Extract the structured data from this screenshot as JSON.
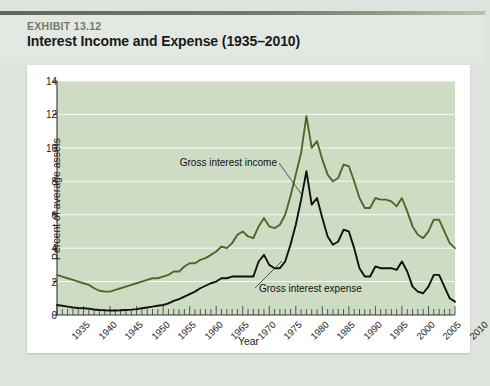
{
  "header": {
    "exhibit_label": "EXHIBIT 13.12",
    "title": "Interest Income and Expense (1935–2010)"
  },
  "chart_data": {
    "type": "line",
    "title": "Interest Income and Expense (1935–2010)",
    "xlabel": "Year",
    "ylabel": "Percent of average assets",
    "xlim": [
      1935,
      2010
    ],
    "ylim": [
      0,
      14
    ],
    "yticks": [
      0,
      2,
      4,
      6,
      8,
      10,
      12,
      14
    ],
    "xticks": [
      1935,
      1940,
      1945,
      1950,
      1955,
      1960,
      1965,
      1970,
      1975,
      1980,
      1985,
      1990,
      1995,
      2000,
      2005,
      2010
    ],
    "grid": "horizontal",
    "legend": "inline-annotations",
    "plot_background": "#cfdcc4",
    "annotations": [
      {
        "text": "Gross interest income",
        "series": "Gross interest income"
      },
      {
        "text": "Gross interest expense",
        "series": "Gross interest expense"
      }
    ],
    "x": [
      1935,
      1936,
      1937,
      1938,
      1939,
      1940,
      1941,
      1942,
      1943,
      1944,
      1945,
      1946,
      1947,
      1948,
      1949,
      1950,
      1951,
      1952,
      1953,
      1954,
      1955,
      1956,
      1957,
      1958,
      1959,
      1960,
      1961,
      1962,
      1963,
      1964,
      1965,
      1966,
      1967,
      1968,
      1969,
      1970,
      1971,
      1972,
      1973,
      1974,
      1975,
      1976,
      1977,
      1978,
      1979,
      1980,
      1981,
      1982,
      1983,
      1984,
      1985,
      1986,
      1987,
      1988,
      1989,
      1990,
      1991,
      1992,
      1993,
      1994,
      1995,
      1996,
      1997,
      1998,
      1999,
      2000,
      2001,
      2002,
      2003,
      2004,
      2005,
      2006,
      2007,
      2008,
      2009,
      2010
    ],
    "series": [
      {
        "name": "Gross interest income",
        "color": "#4b6a27",
        "values": [
          2.4,
          2.3,
          2.2,
          2.1,
          2.0,
          1.9,
          1.8,
          1.6,
          1.45,
          1.4,
          1.4,
          1.5,
          1.6,
          1.7,
          1.8,
          1.9,
          2.0,
          2.1,
          2.2,
          2.2,
          2.3,
          2.4,
          2.6,
          2.6,
          2.9,
          3.1,
          3.1,
          3.3,
          3.4,
          3.6,
          3.8,
          4.1,
          4.0,
          4.3,
          4.8,
          5.0,
          4.7,
          4.6,
          5.3,
          5.8,
          5.3,
          5.2,
          5.4,
          6.0,
          7.1,
          8.4,
          9.7,
          11.9,
          10.0,
          10.4,
          9.3,
          8.4,
          8.0,
          8.2,
          9.0,
          8.9,
          8.0,
          7.0,
          6.4,
          6.4,
          7.0,
          6.9,
          6.9,
          6.8,
          6.5,
          7.0,
          6.2,
          5.3,
          4.8,
          4.6,
          5.0,
          5.7,
          5.7,
          5.0,
          4.3,
          4.0
        ]
      },
      {
        "name": "Gross interest expense",
        "color": "#111111",
        "values": [
          0.6,
          0.55,
          0.5,
          0.45,
          0.42,
          0.4,
          0.38,
          0.33,
          0.3,
          0.28,
          0.27,
          0.27,
          0.28,
          0.3,
          0.32,
          0.35,
          0.4,
          0.45,
          0.5,
          0.55,
          0.6,
          0.7,
          0.85,
          0.95,
          1.1,
          1.25,
          1.4,
          1.6,
          1.75,
          1.9,
          2.0,
          2.2,
          2.2,
          2.3,
          2.3,
          2.3,
          2.3,
          2.3,
          3.2,
          3.6,
          3.0,
          2.8,
          2.8,
          3.2,
          4.2,
          5.4,
          6.9,
          8.6,
          6.6,
          7.0,
          5.8,
          4.7,
          4.2,
          4.4,
          5.1,
          5.0,
          4.0,
          2.8,
          2.3,
          2.3,
          2.9,
          2.8,
          2.8,
          2.8,
          2.7,
          3.2,
          2.6,
          1.7,
          1.4,
          1.3,
          1.7,
          2.4,
          2.4,
          1.7,
          1.0,
          0.8
        ]
      }
    ]
  }
}
